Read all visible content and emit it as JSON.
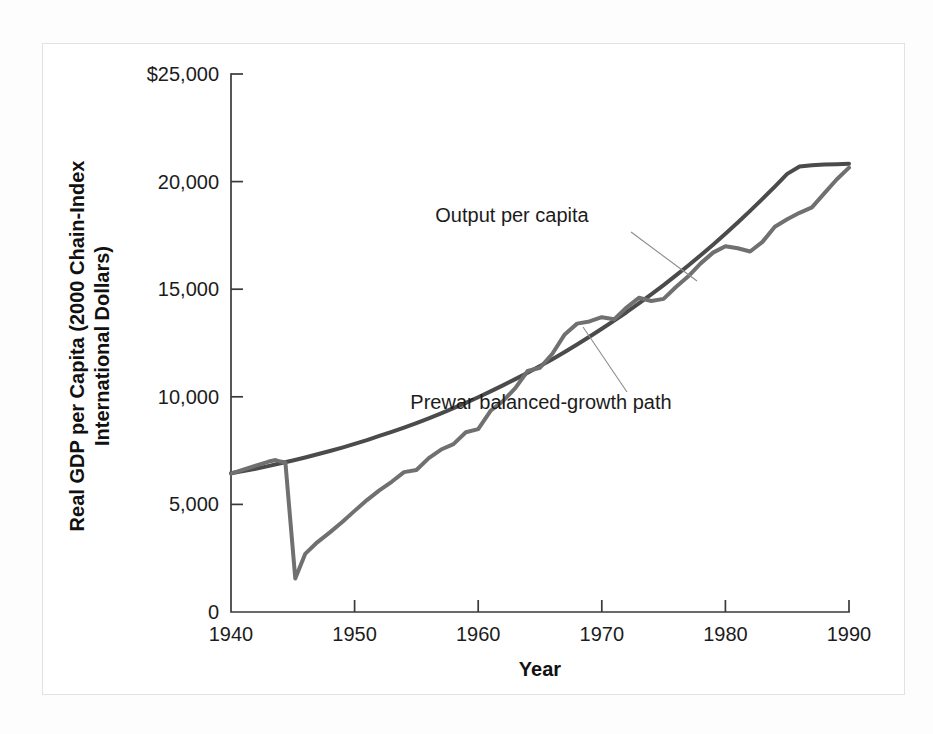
{
  "figure": {
    "background_color": "#ffffff",
    "frame_color": "#e2e2e2"
  },
  "chart_data": {
    "type": "line",
    "title": "",
    "xlabel": "Year",
    "ylabel": "Real GDP per Capita (2000 Chain-Index International Dollars)",
    "xlim": [
      1940,
      1990
    ],
    "ylim": [
      0,
      25000
    ],
    "grid": false,
    "legend_position": "inline-annotations",
    "xticks": [
      1940,
      1950,
      1960,
      1970,
      1980,
      1990
    ],
    "xtick_labels": [
      "1940",
      "1950",
      "1960",
      "1970",
      "1980",
      "1990"
    ],
    "yticks": [
      0,
      5000,
      10000,
      15000,
      20000,
      25000
    ],
    "ytick_labels": [
      "0",
      "5,000",
      "10,000",
      "15,000",
      "20,000",
      "$25,000"
    ],
    "series": [
      {
        "name": "Prewar balanced-growth path",
        "color": "#4b4b4b",
        "linewidth": 4.0,
        "x": [
          1940,
          1941,
          1942,
          1943,
          1944,
          1945,
          1946,
          1947,
          1948,
          1949,
          1950,
          1951,
          1952,
          1953,
          1954,
          1955,
          1956,
          1957,
          1958,
          1959,
          1960,
          1961,
          1962,
          1963,
          1964,
          1965,
          1966,
          1967,
          1968,
          1969,
          1970,
          1971,
          1972,
          1973,
          1974,
          1975,
          1976,
          1977,
          1978,
          1979,
          1980,
          1981,
          1982,
          1983,
          1984,
          1985,
          1986,
          1987,
          1988,
          1989,
          1990
        ],
        "values": [
          6450,
          6550,
          6660,
          6780,
          6910,
          7040,
          7180,
          7330,
          7480,
          7640,
          7810,
          7990,
          8180,
          8370,
          8570,
          8780,
          9000,
          9230,
          9470,
          9720,
          9980,
          10250,
          10530,
          10820,
          11120,
          11430,
          11750,
          12080,
          12430,
          12790,
          13160,
          13540,
          13930,
          14340,
          14760,
          15190,
          15640,
          16100,
          16580,
          17070,
          17580,
          18100,
          18640,
          19200,
          19770,
          20360,
          20700,
          20760,
          20790,
          20810,
          20830
        ]
      },
      {
        "name": "Output per capita",
        "color": "#707070",
        "linewidth": 4.0,
        "x": [
          1940,
          1941,
          1942,
          1943,
          1943.6,
          1944,
          1944.4,
          1945.2,
          1946,
          1947,
          1948,
          1949,
          1950,
          1951,
          1952,
          1953,
          1954,
          1955,
          1956,
          1957,
          1958,
          1959,
          1960,
          1961,
          1962,
          1963,
          1964,
          1965,
          1966,
          1967,
          1968,
          1969,
          1970,
          1971,
          1972,
          1973,
          1974,
          1975,
          1976,
          1977,
          1978,
          1979,
          1980,
          1981,
          1982,
          1983,
          1984,
          1985,
          1986,
          1987,
          1988,
          1989,
          1990
        ],
        "values": [
          6430,
          6620,
          6800,
          6980,
          7060,
          6990,
          6950,
          1560,
          2700,
          3250,
          3700,
          4180,
          4700,
          5200,
          5650,
          6050,
          6500,
          6600,
          7150,
          7550,
          7800,
          8350,
          8500,
          9350,
          9800,
          10400,
          11200,
          11350,
          12000,
          12900,
          13400,
          13500,
          13700,
          13600,
          14150,
          14600,
          14450,
          14550,
          15100,
          15600,
          16200,
          16700,
          17000,
          16900,
          16750,
          17200,
          17900,
          18250,
          18550,
          18800,
          19450,
          20100,
          20650
        ]
      }
    ],
    "annotations": [
      {
        "name": "output-per-capita-annotation",
        "text": "Output per capita",
        "label_x": 512,
        "label_y": 222,
        "leader_from": [
          631,
          232
        ],
        "leader_to": [
          697,
          281
        ]
      },
      {
        "name": "prewar-path-annotation",
        "text": "Prewar balanced-growth path",
        "label_x": 541,
        "label_y": 409,
        "leader_from": [
          627,
          392
        ],
        "leader_to": [
          583,
          327
        ]
      }
    ]
  },
  "axes": {
    "x_axis_title": "Year",
    "y_axis_title_line1": "Real GDP per Capita (2000 Chain-Index",
    "y_axis_title_line2": "International Dollars)"
  }
}
